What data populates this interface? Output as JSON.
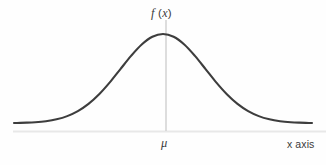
{
  "figure": {
    "background_color": "#fefefe",
    "width": 326,
    "height": 165
  },
  "labels": {
    "density_f": "f",
    "density_open_paren": " (",
    "density_x": "x",
    "density_close_paren": ")",
    "density_full": "f (x)",
    "mean_symbol": "μ",
    "x_axis": "x axis"
  },
  "colors": {
    "curve": "#3d3d3d",
    "axis": "#e8e8e8",
    "vertical_line": "#cfcfcf",
    "text": "#3b3b3b"
  },
  "chart_data": {
    "type": "line",
    "title": "",
    "subtitle": "",
    "xlabel": "x axis",
    "ylabel": "f (x)",
    "grid": false,
    "legend": null,
    "annotations": [
      {
        "text": "f (x)",
        "role": "y-axis-label",
        "x_px": 166,
        "y_px": 14
      },
      {
        "text": "μ",
        "role": "x-tick-label",
        "x_px": 166,
        "y_px": 143
      },
      {
        "text": "x axis",
        "role": "x-axis-label",
        "x_px": 303,
        "y_px": 145
      }
    ],
    "distribution": "normal",
    "mean_px": 166,
    "peak_y_px": 34,
    "baseline_y_px": 131,
    "tail_y_px": 123,
    "curve_start_x_px": 14,
    "curve_end_x_px": 312,
    "axis_start_x_px": 13,
    "axis_end_x_px": 326,
    "x": [
      -3.5,
      -3.2,
      -3.0,
      -2.75,
      -2.5,
      -2.25,
      -2.0,
      -1.75,
      -1.5,
      -1.25,
      -1.0,
      -0.75,
      -0.5,
      -0.25,
      0,
      0.25,
      0.5,
      0.75,
      1.0,
      1.25,
      1.5,
      1.75,
      2.0,
      2.25,
      2.5,
      2.75,
      3.0,
      3.2,
      3.5
    ],
    "y": [
      0.0009,
      0.0024,
      0.0044,
      0.0091,
      0.0175,
      0.0317,
      0.054,
      0.0863,
      0.1295,
      0.1826,
      0.242,
      0.3011,
      0.3521,
      0.3867,
      0.3989,
      0.3867,
      0.3521,
      0.3011,
      0.242,
      0.1826,
      0.1295,
      0.0863,
      0.054,
      0.0317,
      0.0175,
      0.0091,
      0.0044,
      0.0024,
      0.0009
    ],
    "xlim": [
      -3.5,
      3.5
    ],
    "ylim": [
      0,
      0.42
    ],
    "x_tick_labels": [
      "μ"
    ],
    "x_tick_values": [
      0
    ],
    "y_tick_labels": [],
    "y_tick_values": []
  }
}
